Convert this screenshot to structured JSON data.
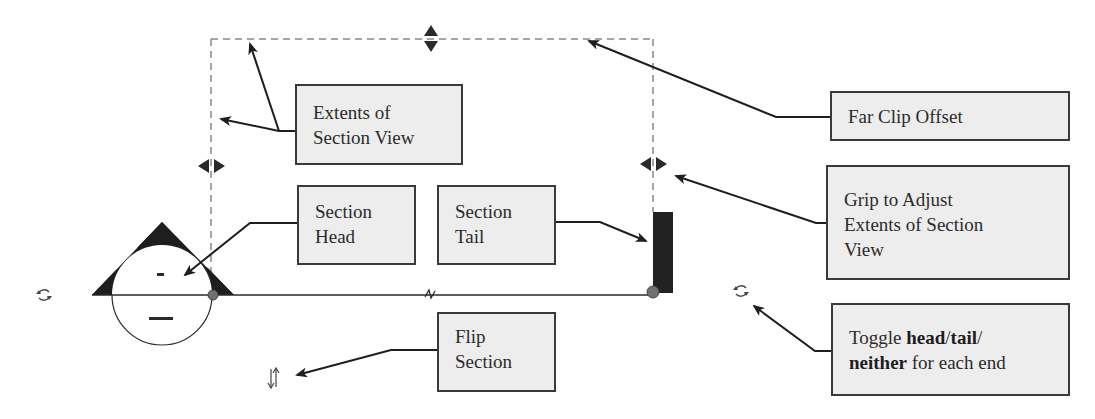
{
  "diagram": {
    "callouts": {
      "extents": {
        "line1": "Extents of",
        "line2": "Section View"
      },
      "far_clip": {
        "label": "Far Clip Offset"
      },
      "grip": {
        "line1": "Grip to Adjust",
        "line2": "Extents of Section",
        "line3": "View"
      },
      "section_head": {
        "line1": "Section",
        "line2": "Head"
      },
      "section_tail": {
        "line1": "Section",
        "line2": "Tail"
      },
      "flip": {
        "line1": "Flip",
        "line2": "Section"
      },
      "toggle": {
        "prefix": "Toggle ",
        "bold1": "head",
        "sep1": "/",
        "bold2": "tail",
        "sep2": "/",
        "bold3": "neither",
        "suffix": " for each end"
      }
    },
    "head_symbol": {
      "top_mark": "-",
      "bottom_mark": "---"
    },
    "icons": [
      "cycle-icon",
      "cycle-icon",
      "flip-arrows-icon",
      "grip-horizontal-icon",
      "grip-vertical-icon",
      "break-line-icon"
    ],
    "colors": {
      "box_fill": "#ededed",
      "box_border": "#3a3a3a",
      "ink": "#2a2a2a",
      "dashed": "#888888",
      "endpoint_dot": "#707070"
    }
  }
}
